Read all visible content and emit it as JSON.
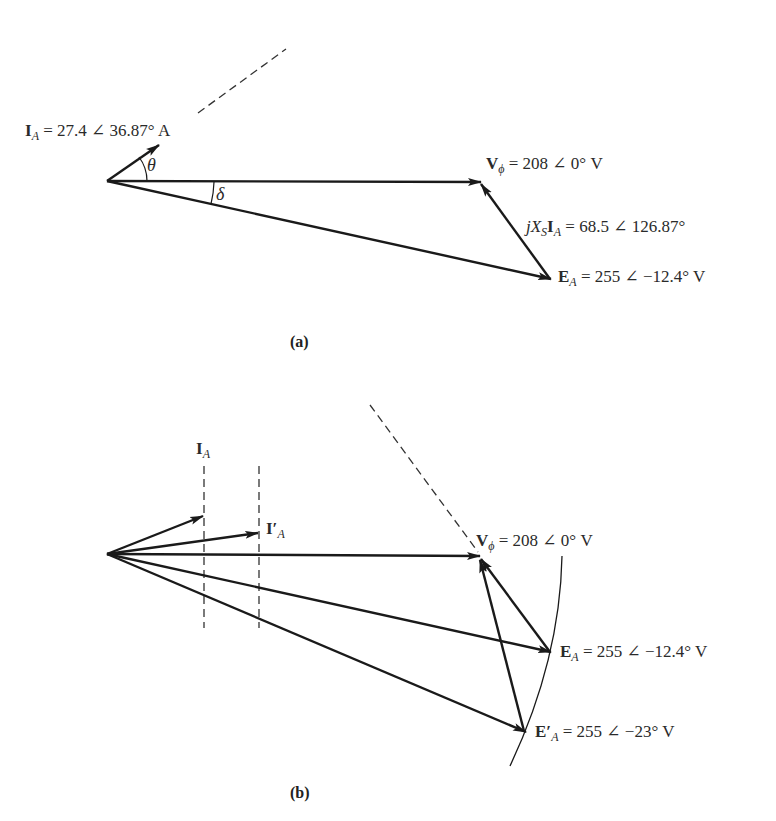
{
  "diagram_a": {
    "caption": "(a)",
    "labels": {
      "current": {
        "symbol": "I",
        "sub": "A",
        "value": " = 27.4 ∠ 36.87° A"
      },
      "voltage": {
        "symbol": "V",
        "sub": "ϕ",
        "value": " = 208 ∠ 0° V"
      },
      "reactance_drop": {
        "prefix": "jX",
        "sub1": "S",
        "symbol": "I",
        "sub2": "A",
        "value": " = 68.5 ∠ 126.87°"
      },
      "emf": {
        "symbol": "E",
        "sub": "A",
        "value": " = 255 ∠ −12.4° V"
      }
    },
    "angles": {
      "theta": "θ",
      "delta": "δ"
    },
    "phasors": {
      "I_A": {
        "magnitude": 27.4,
        "angle_deg": 36.87,
        "unit": "A"
      },
      "V_phi": {
        "magnitude": 208,
        "angle_deg": 0,
        "unit": "V"
      },
      "jXsIA": {
        "magnitude": 68.5,
        "angle_deg": 126.87
      },
      "E_A": {
        "magnitude": 255,
        "angle_deg": -12.4,
        "unit": "V"
      }
    }
  },
  "diagram_b": {
    "caption": "(b)",
    "labels": {
      "current": {
        "symbol": "I",
        "sub": "A"
      },
      "current_new": {
        "symbol": "I′",
        "sub": "A"
      },
      "voltage": {
        "symbol": "V",
        "sub": "ϕ",
        "value": " = 208 ∠ 0° V"
      },
      "emf": {
        "symbol": "E",
        "sub": "A",
        "value": " = 255 ∠ −12.4° V"
      },
      "emf_new": {
        "symbol": "E′",
        "sub": "A",
        "value": " = 255 ∠ −23° V"
      }
    },
    "phasors": {
      "V_phi": {
        "magnitude": 208,
        "angle_deg": 0,
        "unit": "V"
      },
      "E_A": {
        "magnitude": 255,
        "angle_deg": -12.4,
        "unit": "V"
      },
      "E_A_prime": {
        "magnitude": 255,
        "angle_deg": -23,
        "unit": "V"
      }
    }
  },
  "colors": {
    "ink": "#1a1a1a",
    "text": "#2a2a2a",
    "background": "#ffffff"
  }
}
